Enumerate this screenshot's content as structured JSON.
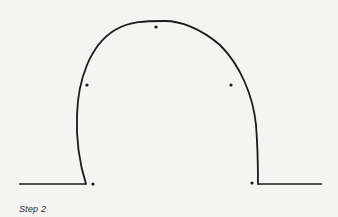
{
  "figure": {
    "caption": "Step 2",
    "stroke_color": "#1a1a1a",
    "background": "#f4f4f2",
    "baseline_left": {
      "x1": 19,
      "y1": 184,
      "x2": 86,
      "y2": 184
    },
    "baseline_right": {
      "x1": 258,
      "y1": 184,
      "x2": 322,
      "y2": 184
    },
    "arch_path": "M86,184 C80,165 76,140 77,115 C78,80 90,45 115,30 C130,21 145,21 165,21 C180,21 200,28 220,45 C240,65 253,95 256,125 C258,150 258,170 258,184",
    "points": [
      {
        "x": 93,
        "y": 184
      },
      {
        "x": 87,
        "y": 85
      },
      {
        "x": 156,
        "y": 27
      },
      {
        "x": 231,
        "y": 85
      },
      {
        "x": 252,
        "y": 183
      }
    ]
  }
}
